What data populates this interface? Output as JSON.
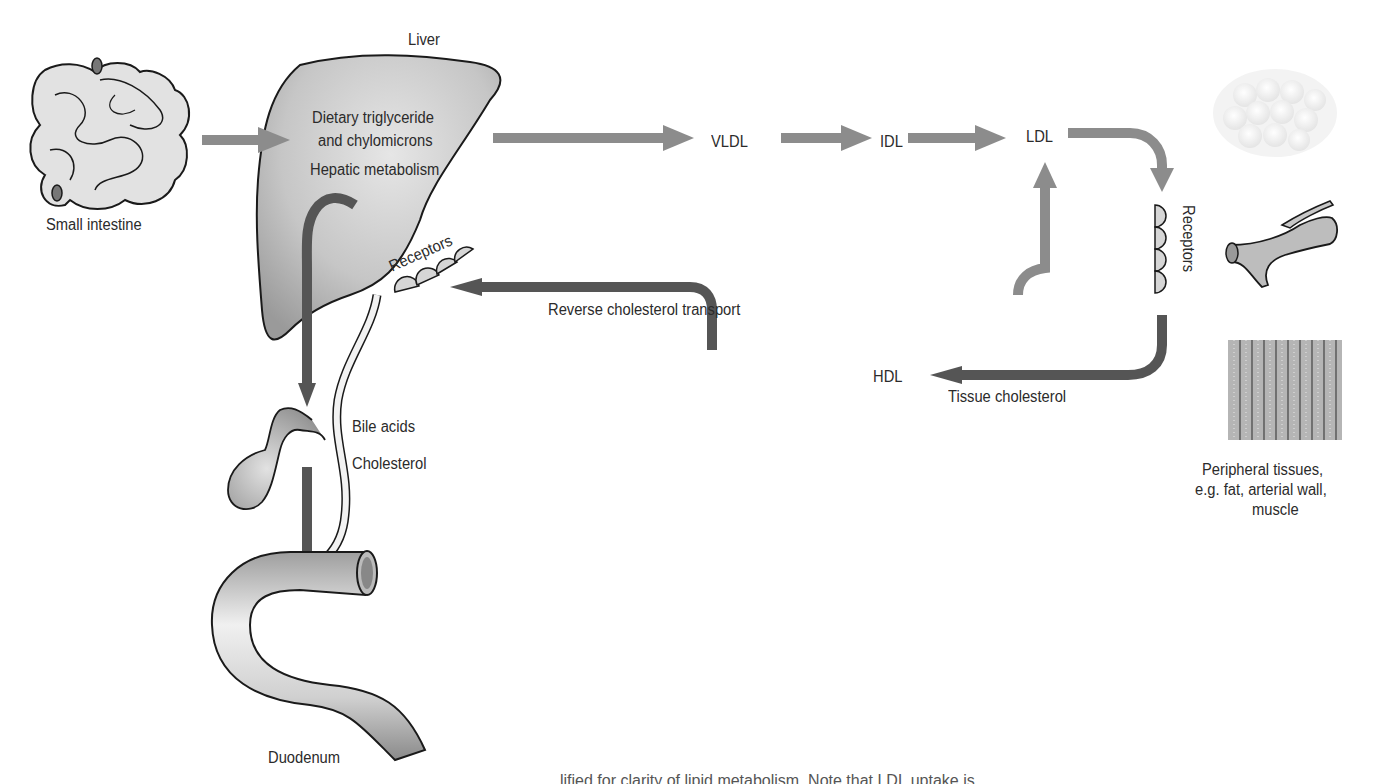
{
  "figure": {
    "organs": {
      "small_intestine": "Small intestine",
      "liver": "Liver",
      "duodenum": "Duodenum",
      "peripheral_tissues": [
        "Peripheral tissues,",
        "e.g. fat, arterial wall,",
        "muscle"
      ]
    },
    "liver_text": {
      "line1": "Dietary triglyceride",
      "line2": "and chylomicrons",
      "line3": "Hepatic metabolism"
    },
    "lipoproteins": {
      "vldl": "VLDL",
      "idl": "IDL",
      "ldl": "LDL",
      "hdl": "HDL"
    },
    "receptors": {
      "liver": "Receptors",
      "peripheral": "Receptors"
    },
    "pathways": {
      "reverse_transport": "Reverse cholesterol transport",
      "tissue_cholesterol": "Tissue cholesterol",
      "bile_acids": "Bile acids",
      "cholesterol": "Cholesterol"
    },
    "caption_partial": "lified for clarity of lipid metabolism. Note that LDL uptake is"
  },
  "colors": {
    "light_arrow": "#8c8c8c",
    "dark_arrow": "#555555",
    "organ_fill": "#c8c8c8",
    "outline": "#1a1a1a"
  }
}
